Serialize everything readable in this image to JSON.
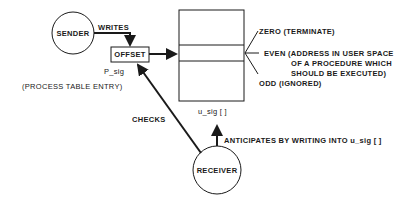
{
  "nodes": {
    "sender": {
      "label": "SENDER"
    },
    "receiver": {
      "label": "RECEIVER"
    },
    "offset": {
      "label": "OFFSET",
      "caption": "P_sig"
    },
    "usig": {
      "caption": "u_sig [ ]"
    }
  },
  "edges": {
    "writes": "WRITES",
    "checks": "CHECKS",
    "anticipates": "ANTICIPATES BY WRITING INTO u_sig [ ]"
  },
  "annotations": {
    "process_table": "(PROCESS TABLE ENTRY)",
    "zero": "ZERO (TERMINATE)",
    "even_line1": "EVEN (ADDRESS IN USER SPACE",
    "even_line2": "OF A PROCEDURE WHICH",
    "even_line3": "SHOULD BE EXECUTED)",
    "odd": "ODD (IGNORED)"
  },
  "colors": {
    "stroke": "#1a1a1a",
    "background": "#ffffff"
  }
}
